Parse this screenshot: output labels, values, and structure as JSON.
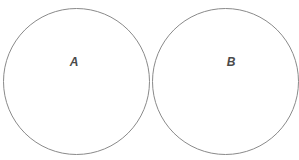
{
  "diagram": {
    "type": "two-circles",
    "circles": [
      {
        "label": "A",
        "cx": 76,
        "cy": 81,
        "r": 73
      },
      {
        "label": "B",
        "cx": 226,
        "cy": 81,
        "r": 73
      }
    ],
    "stroke_color": "#8a8a8a",
    "label_color": "#4a4a4a"
  }
}
